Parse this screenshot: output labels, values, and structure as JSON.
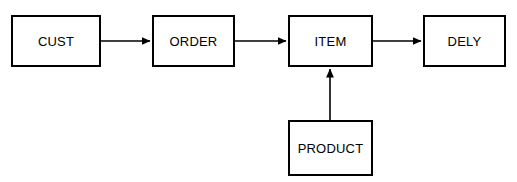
{
  "diagram": {
    "type": "flow-diagram",
    "background_color": "#ffffff",
    "line_color": "#000000",
    "text_color": "#000000",
    "nodes": [
      {
        "id": "cust",
        "label": "CUST",
        "x": 11,
        "y": 15,
        "width": 90,
        "height": 52
      },
      {
        "id": "order",
        "label": "ORDER",
        "x": 152,
        "y": 15,
        "width": 83,
        "height": 52
      },
      {
        "id": "item",
        "label": "ITEM",
        "x": 288,
        "y": 15,
        "width": 85,
        "height": 52
      },
      {
        "id": "dely",
        "label": "DELY",
        "x": 423,
        "y": 15,
        "width": 83,
        "height": 52
      },
      {
        "id": "product",
        "label": "PRODUCT",
        "x": 288,
        "y": 120,
        "width": 85,
        "height": 56
      }
    ],
    "edges": [
      {
        "id": "cust-to-order",
        "from": "cust",
        "to": "order",
        "direction": "right"
      },
      {
        "id": "order-to-item",
        "from": "order",
        "to": "item",
        "direction": "right"
      },
      {
        "id": "item-to-dely",
        "from": "item",
        "to": "dely",
        "direction": "right"
      },
      {
        "id": "product-to-item",
        "from": "product",
        "to": "item",
        "direction": "up"
      }
    ]
  }
}
